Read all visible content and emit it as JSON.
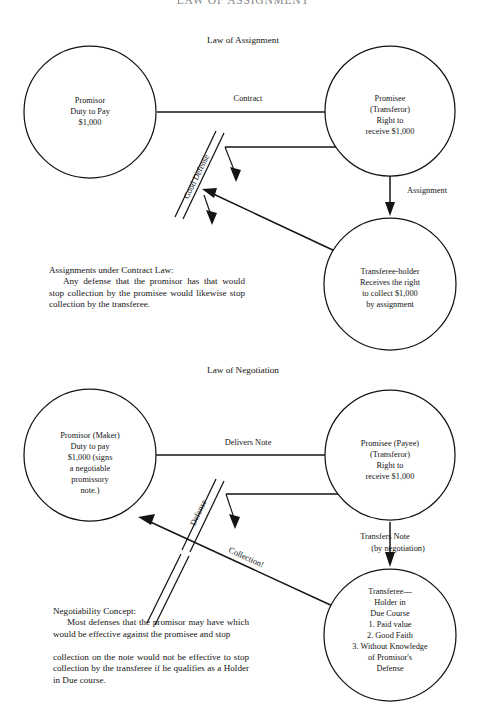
{
  "document": {
    "title": "LAW OF ASSIGNMENT",
    "width": 486,
    "height": 728,
    "ink_color": "#141414",
    "background_color": "#ffffff"
  },
  "sections": [
    {
      "id": "assignment",
      "heading": "Law of Assignment",
      "nodes": {
        "promisor": [
          "Promisor",
          "Duty to Pay",
          "$1,000"
        ],
        "promisee": [
          "Promisee",
          "(Transferor)",
          "Right to",
          "receive $1,000"
        ],
        "transferee": [
          "Transferee-holder",
          "Receives the right",
          "to collect $1,000",
          "by assignment"
        ]
      },
      "edges": {
        "contract": "Contract",
        "assignment": "Assignment",
        "defense": "Good Defense"
      },
      "note": {
        "heading": "Assignments under Contract Law:",
        "body": "Any defense that the promisor has that would stop collection by the promisee would likewise stop collection by the transferee."
      }
    },
    {
      "id": "negotiation",
      "heading": "Law of Negotiation",
      "nodes": {
        "promisor": [
          "Promisor (Maker)",
          "Duty to pay",
          "$1,000 (signs",
          "a negotiable",
          "promissory",
          "note.)"
        ],
        "promisee": [
          "Promisee (Payee)",
          "(Transferor)",
          "Right to",
          "receive $1,000"
        ],
        "transferee": [
          "Transferee—",
          "Holder in",
          "Due Course",
          "1.  Paid value",
          "2.  Good Faith",
          "3.  Without Knowledge",
          "of Promisor's",
          "Defense"
        ]
      },
      "edges": {
        "delivers": "Delivers Note",
        "transfers_line1": "Transfers Note",
        "transfers_line2": "(by  negotiation)",
        "defense": "Defense",
        "collection": "Collection!"
      },
      "note": {
        "heading": "Negotiability Concept:",
        "body_part1": "Most defenses that the promisor may have which would be effective against the promisee and stop",
        "body_part2": "collection on the note would not be effective to stop collection by the transferee if he qualifies as a Holder in Due course."
      }
    }
  ]
}
